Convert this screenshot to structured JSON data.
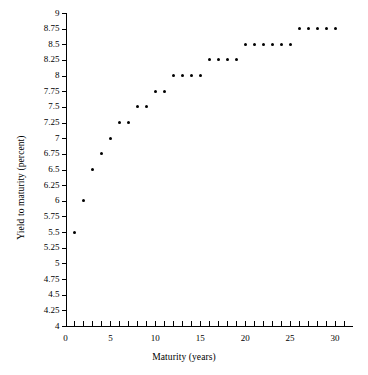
{
  "chart_data": {
    "type": "scatter",
    "title": "",
    "xlabel": "Maturity (years)",
    "ylabel": "Yield to maturity (percent)",
    "xlim": [
      0,
      32
    ],
    "ylim": [
      4,
      9
    ],
    "grid": false,
    "legend": null,
    "x_tick_labels": [
      "0",
      "5",
      "10",
      "15",
      "20",
      "25",
      "30"
    ],
    "x_tick_values": [
      0,
      5,
      10,
      15,
      20,
      25,
      30
    ],
    "x_minor_tick_step": 1,
    "y_tick_labels": [
      "4",
      "4.25",
      "4.5",
      "4.75",
      "5",
      "5.25",
      "5.5",
      "5.75",
      "6",
      "6.25",
      "6.5",
      "6.75",
      "7",
      "7.25",
      "7.5",
      "7.75",
      "8",
      "8.25",
      "8.5",
      "8.75",
      "9"
    ],
    "y_tick_values": [
      4,
      4.25,
      4.5,
      4.75,
      5,
      5.25,
      5.5,
      5.75,
      6,
      6.25,
      6.5,
      6.75,
      7,
      7.25,
      7.5,
      7.75,
      8,
      8.25,
      8.5,
      8.75,
      9
    ],
    "marker_color": "#000000",
    "x": [
      1,
      2,
      3,
      4,
      5,
      6,
      7,
      8,
      9,
      10,
      11,
      12,
      13,
      14,
      15,
      16,
      17,
      18,
      19,
      20,
      21,
      22,
      23,
      24,
      25,
      26,
      27,
      28,
      29,
      30
    ],
    "y": [
      5.5,
      6,
      6.5,
      6.75,
      7,
      7.25,
      7.25,
      7.5,
      7.5,
      7.75,
      7.75,
      8,
      8,
      8,
      8,
      8.25,
      8.25,
      8.25,
      8.25,
      8.5,
      8.5,
      8.5,
      8.5,
      8.5,
      8.5,
      8.75,
      8.75,
      8.75,
      8.75,
      8.75
    ],
    "points": [
      {
        "x": 1,
        "y": 5.5
      },
      {
        "x": 2,
        "y": 6
      },
      {
        "x": 3,
        "y": 6.5
      },
      {
        "x": 4,
        "y": 6.75
      },
      {
        "x": 5,
        "y": 7
      },
      {
        "x": 6,
        "y": 7.25
      },
      {
        "x": 7,
        "y": 7.25
      },
      {
        "x": 8,
        "y": 7.5
      },
      {
        "x": 9,
        "y": 7.5
      },
      {
        "x": 10,
        "y": 7.75
      },
      {
        "x": 11,
        "y": 7.75
      },
      {
        "x": 12,
        "y": 8
      },
      {
        "x": 13,
        "y": 8
      },
      {
        "x": 14,
        "y": 8
      },
      {
        "x": 15,
        "y": 8
      },
      {
        "x": 16,
        "y": 8.25
      },
      {
        "x": 17,
        "y": 8.25
      },
      {
        "x": 18,
        "y": 8.25
      },
      {
        "x": 19,
        "y": 8.25
      },
      {
        "x": 20,
        "y": 8.5
      },
      {
        "x": 21,
        "y": 8.5
      },
      {
        "x": 22,
        "y": 8.5
      },
      {
        "x": 23,
        "y": 8.5
      },
      {
        "x": 24,
        "y": 8.5
      },
      {
        "x": 25,
        "y": 8.5
      },
      {
        "x": 26,
        "y": 8.75
      },
      {
        "x": 27,
        "y": 8.75
      },
      {
        "x": 28,
        "y": 8.75
      },
      {
        "x": 29,
        "y": 8.75
      },
      {
        "x": 30,
        "y": 8.75
      }
    ]
  }
}
